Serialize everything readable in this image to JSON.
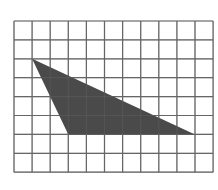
{
  "diagram": {
    "type": "grid-with-shaded-triangle",
    "grid": {
      "columns": 11,
      "rows": 8,
      "origin_px": [
        14,
        21
      ],
      "cell_width_px": 18.1,
      "cell_height_px": 18.9,
      "line_color": "#666666",
      "background": "#ffffff"
    },
    "triangle": {
      "vertices_grid": [
        [
          1,
          2
        ],
        [
          3,
          6
        ],
        [
          10,
          6
        ]
      ],
      "fill_color": "#4a4a4a"
    }
  }
}
